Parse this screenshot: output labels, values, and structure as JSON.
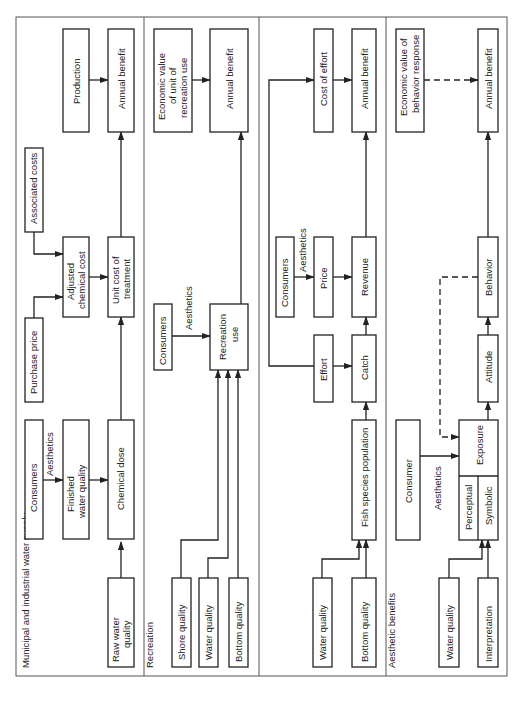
{
  "diagram": {
    "orientation": "rotated 90 degrees counter-clockwise",
    "panels": [
      {
        "title": "Municipal and industrial water supply",
        "nodes": {
          "raw_water_quality": "Raw water quality",
          "consumers": "Consumers",
          "aesthetics": "Aesthetics",
          "finished_water_quality": "Finished water quality",
          "chemical_dose": "Chemical dose",
          "purchase_price": "Purchase price",
          "adjusted_chemical_cost": "Adjusted chemical cost",
          "associated_costs": "Associated costs",
          "unit_cost_of_treatment": "Unit cost of treatment",
          "production": "Production",
          "annual_benefit": "Annual benefit"
        }
      },
      {
        "title": "Recreation",
        "nodes": {
          "shore_quality": "Shore quality",
          "water_quality": "Water quality",
          "bottom_quality": "Bottom quality",
          "consumers": "Consumers",
          "aesthetics": "Aesthetics",
          "recreation_use": "Recreation use",
          "economic_value": "Economic value of unit of recreation use",
          "annual_benefit": "Annual benefit"
        }
      },
      {
        "title": "",
        "nodes": {
          "water_quality": "Water quality",
          "bottom_quality": "Bottom quality",
          "fish_species_population": "Fish species population",
          "effort": "Effort",
          "catch": "Catch",
          "consumers": "Consumers",
          "aesthetics": "Aesthetics",
          "price": "Price",
          "revenue": "Revenue",
          "cost_of_effort": "Cost of effort",
          "annual_benefit": "Annual benefit"
        }
      },
      {
        "title": "Aesthetic benefits",
        "nodes": {
          "water_quality": "Water quality",
          "interpretation": "Interpretation",
          "consumer": "Consumer",
          "aesthetics": "Aesthetics",
          "perceptual": "Perceptual",
          "symbolic": "Symbolic",
          "exposure": "Exposure",
          "attitude": "Attitude",
          "behavior": "Behavior",
          "economic_value": "Economic value of behavior response",
          "annual_benefit": "Annual benefit"
        }
      }
    ]
  }
}
